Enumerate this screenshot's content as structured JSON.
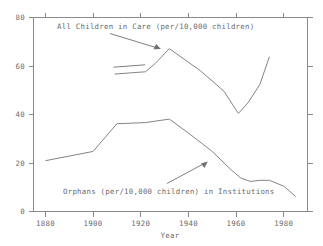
{
  "chart_data": {
    "type": "line",
    "title": "",
    "xlabel": "Year",
    "ylabel": "",
    "xlim": [
      1875,
      1990
    ],
    "ylim": [
      0,
      84
    ],
    "grid": false,
    "legend_position": "inline-annotations",
    "xticks": [
      1880,
      1900,
      1920,
      1940,
      1960,
      1980
    ],
    "xtick_labels": [
      "1880",
      "1900",
      "1920",
      "1940",
      "1960",
      "1980"
    ],
    "yticks": [
      0,
      20,
      40,
      60,
      80
    ],
    "ytick_labels": [
      "0",
      "20",
      "40",
      "60",
      "80"
    ],
    "series": [
      {
        "name": "All Children in Care (per/10,000 children)",
        "x": [
          1909,
          1922,
          1926,
          1932,
          1945,
          1955,
          1960,
          1961,
          1965,
          1970,
          1974
        ],
        "values": [
          59.5,
          60.5,
          64.0,
          70.5,
          61.0,
          52.0,
          44.0,
          42.5,
          47.0,
          55.0,
          67.0
        ]
      },
      {
        "name": "Orphans (per/10,000 children) in Institutions",
        "x": [
          1880,
          1890,
          1900,
          1910,
          1922,
          1932,
          1940,
          1950,
          1958,
          1962,
          1966,
          1970,
          1974,
          1980,
          1985
        ],
        "values": [
          22.0,
          24.0,
          26.0,
          38.0,
          38.5,
          40.0,
          34.0,
          26.0,
          18.0,
          14.5,
          13.0,
          13.5,
          13.5,
          11.0,
          6.5
        ]
      }
    ],
    "annotations": [
      {
        "text": "All Children in Care (per/10,000 children)",
        "points_to_series": "All Children in Care (per/10,000 children)"
      },
      {
        "text": "Orphans (per/10,000 children) in Institutions",
        "points_to_series": "Orphans (per/10,000 children) in Institutions"
      }
    ]
  },
  "colors": {
    "background": "#ffffff",
    "axis": "#8a8a8a",
    "series_line": "#767676",
    "text": "#6b6b6b"
  }
}
